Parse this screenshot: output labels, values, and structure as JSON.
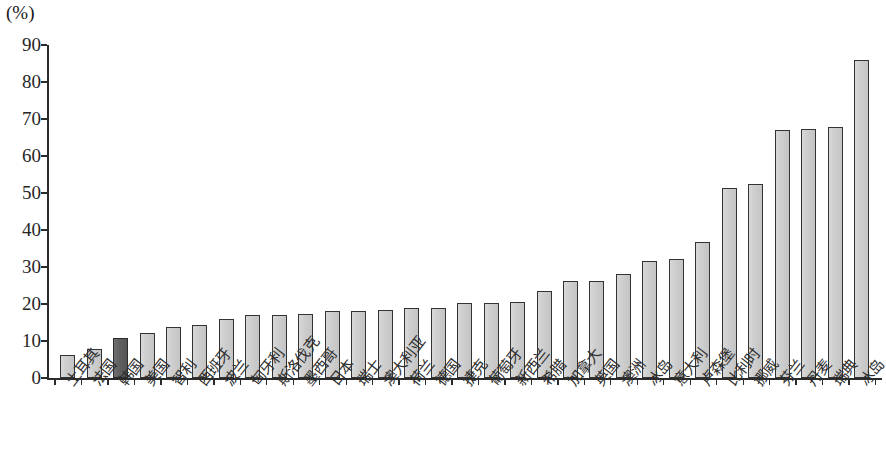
{
  "chart_data": {
    "type": "bar",
    "title": "",
    "subtitle": "",
    "xlabel": "",
    "ylabel": "",
    "unit_label": "(%)",
    "ylim": [
      0,
      90
    ],
    "ytick_step": 10,
    "yticks": [
      0,
      10,
      20,
      30,
      40,
      50,
      60,
      70,
      80,
      90
    ],
    "grid": false,
    "legend": false,
    "categories": [
      "土耳其",
      "法国",
      "韩国",
      "美国",
      "智利",
      "西班牙",
      "波兰",
      "匈牙利",
      "斯洛伐克",
      "墨西哥",
      "日本",
      "瑞士",
      "澳大利亚",
      "荷兰",
      "德国",
      "捷克",
      "葡萄牙",
      "新西兰",
      "希腊",
      "加拿大",
      "英国",
      "澳洲",
      "冰岛",
      "意大利",
      "卢森堡",
      "比利时",
      "挪威",
      "芬兰",
      "丹麦",
      "瑞典",
      "冰岛"
    ],
    "values": [
      6.2,
      7.9,
      10.7,
      12.1,
      13.9,
      14.2,
      16.0,
      17.0,
      17.0,
      17.3,
      18.2,
      18.2,
      18.3,
      18.9,
      19.0,
      20.3,
      20.3,
      20.5,
      23.6,
      26.3,
      26.2,
      28.2,
      31.5,
      32.3,
      36.7,
      51.4,
      52.4,
      67.0,
      67.4,
      67.8,
      86.0
    ],
    "highlight_index": 2,
    "colors": {
      "bar_fill": "#cfcfcf",
      "bar_border": "#333333",
      "highlight_fill": "#5e5e5e",
      "axis": "#2b2b2b",
      "text": "#262626",
      "background": "#ffffff"
    }
  }
}
